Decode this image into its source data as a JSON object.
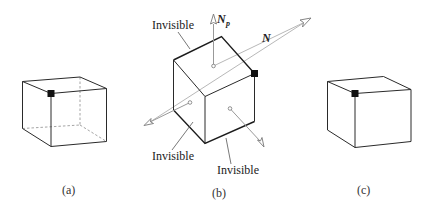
{
  "figure": {
    "panels": [
      {
        "id": "a",
        "caption": "(a)",
        "description": "wireframe cube with hidden edges dashed and a marked vertex"
      },
      {
        "id": "b",
        "caption": "(b)",
        "description": "cube with face normals and viewing vector N",
        "labels": {
          "invisible_top": "Invisible",
          "invisible_bottom_left": "Invisible",
          "invisible_bottom_right": "Invisible",
          "view_vector": "N",
          "face_normal": "N",
          "face_normal_sub": "p"
        }
      },
      {
        "id": "c",
        "caption": "(c)",
        "description": "cube with hidden edges removed and a marked vertex"
      }
    ],
    "colors": {
      "edge": "#2a2a2a",
      "hidden_edge": "#9a9a9a",
      "normal_line": "#b8b8b8",
      "marker": "#111111"
    }
  }
}
